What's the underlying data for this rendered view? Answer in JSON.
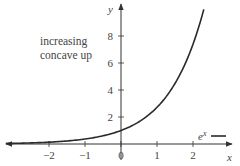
{
  "chart_data": {
    "type": "line",
    "title": "",
    "xlabel": "x",
    "ylabel": "y",
    "function": "e^x",
    "xlim": [
      -3.3,
      3.2
    ],
    "ylim": [
      -0.5,
      10.5
    ],
    "x_ticks": [
      -2,
      -1,
      0,
      1,
      2
    ],
    "x_tick_labels": [
      "−2",
      "−1",
      "0",
      "1",
      "2"
    ],
    "y_ticks": [
      2,
      4,
      6,
      8
    ],
    "y_tick_labels": [
      "2",
      "4",
      "6",
      "8"
    ],
    "grid": false,
    "series": [
      {
        "name": "e^x",
        "x": [
          -3.2,
          -3,
          -2.5,
          -2,
          -1.5,
          -1,
          -0.5,
          0,
          0.5,
          1,
          1.5,
          2,
          2.3
        ],
        "values": [
          0.041,
          0.05,
          0.082,
          0.135,
          0.223,
          0.368,
          0.607,
          1,
          1.649,
          2.718,
          4.482,
          7.389,
          9.974
        ]
      }
    ],
    "annotations": [
      "increasing",
      "concave up"
    ],
    "legend": {
      "entries": [
        "e^x"
      ],
      "position": "lower right"
    }
  },
  "labels": {
    "annotation_line1": "increasing",
    "annotation_line2": "concave up",
    "x_axis": "x",
    "y_axis": "y",
    "legend_base": "e",
    "legend_sup": "x",
    "ticks_x": [
      "−2",
      "−1",
      "0",
      "1",
      "2"
    ],
    "ticks_y": [
      "2",
      "4",
      "6",
      "8"
    ]
  },
  "colors": {
    "curve": "#2a2a2a",
    "axis": "#333333",
    "text": "#444444"
  }
}
